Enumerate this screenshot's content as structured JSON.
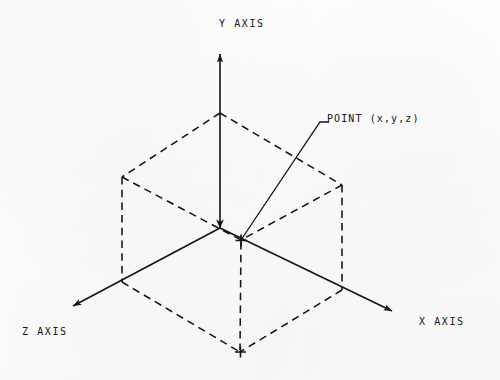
{
  "diagram": {
    "axes": [
      {
        "id": "y",
        "label": "Y AXIS"
      },
      {
        "id": "x",
        "label": "X AXIS"
      },
      {
        "id": "z",
        "label": "Z AXIS"
      }
    ],
    "annotations": [
      {
        "id": "point",
        "label": "POINT (x,y,z)"
      }
    ],
    "colors": {
      "ink": "#141414",
      "paper": "#fdfdfd"
    },
    "geometry": {
      "origin": [
        220,
        228
      ],
      "y_axis_tip": [
        220,
        48
      ],
      "x_axis_tip": [
        397,
        315
      ],
      "z_axis_tip": [
        68,
        310
      ],
      "point_marker": [
        241,
        240
      ],
      "point_projection": [
        240,
        352
      ],
      "cube_top_apex": [
        220,
        113
      ],
      "cube_left_corner": [
        122,
        177
      ],
      "cube_right_corner": [
        342,
        185
      ],
      "cube_bottom_vertex": [
        240,
        352
      ],
      "leader_elbow": [
        320,
        122
      ]
    }
  }
}
